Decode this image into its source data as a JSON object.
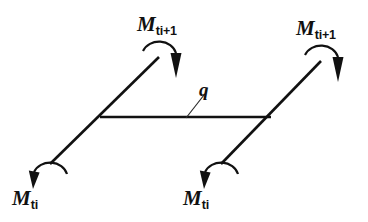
{
  "figure": {
    "type": "engineering-diagram",
    "background_color": "#ffffff",
    "line_color": "#111111",
    "width": 368,
    "height": 222
  },
  "labels": {
    "moment_top_left": {
      "symbol": "M",
      "subscript": "ti+1"
    },
    "moment_top_right": {
      "symbol": "M",
      "subscript": "ti+1"
    },
    "moment_bottom_left": {
      "symbol": "M",
      "subscript": "ti"
    },
    "moment_bottom_right": {
      "symbol": "M",
      "subscript": "ti"
    },
    "distributed_load": {
      "symbol": "q"
    }
  },
  "geometry": {
    "left_member": {
      "x1": 50,
      "y1": 164,
      "x2": 159,
      "y2": 57
    },
    "right_member": {
      "x1": 221,
      "y1": 164,
      "x2": 321,
      "y2": 61
    },
    "beam": {
      "x1": 100,
      "y1": 117,
      "x2": 271,
      "y2": 117
    },
    "leader": {
      "x1": 186,
      "y1": 118,
      "x2": 204,
      "y2": 95
    }
  },
  "moment_arrows": [
    {
      "name": "moment-arrow-top-left",
      "direction": "clockwise",
      "arrowhead": "down",
      "cx": 159,
      "cy": 57
    },
    {
      "name": "moment-arrow-top-right",
      "direction": "clockwise",
      "arrowhead": "down",
      "cx": 321,
      "cy": 61
    },
    {
      "name": "moment-arrow-bottom-left",
      "direction": "clockwise",
      "arrowhead": "down-left",
      "cx": 50,
      "cy": 164
    },
    {
      "name": "moment-arrow-bottom-right",
      "direction": "clockwise",
      "arrowhead": "down-left",
      "cx": 221,
      "cy": 164
    }
  ]
}
